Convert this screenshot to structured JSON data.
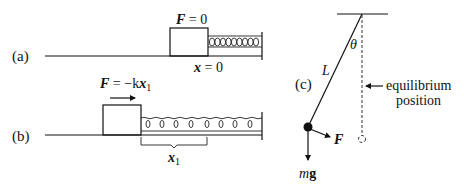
{
  "panel_a": {
    "label": "(a)",
    "force_label_F": "F",
    "force_label_eq": " = 0",
    "position_label_x": "x",
    "position_label_eq": " = 0"
  },
  "panel_b": {
    "label": "(b)",
    "force_label_F": "F",
    "force_label_eq": " = −k",
    "force_label_x": "x",
    "force_label_sub": "1",
    "displacement_label_x": "x",
    "displacement_label_sub": "1"
  },
  "panel_c": {
    "label": "(c)",
    "angle_label": "θ",
    "length_label": "L",
    "equilibrium_label_line1": "equilibrium",
    "equilibrium_label_line2": "position",
    "force_label": "F",
    "weight_label_m": "m",
    "weight_label_g": "g"
  },
  "colors": {
    "ink": "#111111",
    "background": "#ffffff"
  }
}
